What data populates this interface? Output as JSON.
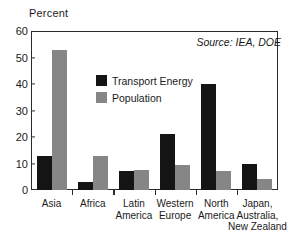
{
  "chart_data": {
    "type": "bar",
    "title": "",
    "xlabel": "",
    "ylabel": "Percent",
    "ylim": [
      0,
      60
    ],
    "yticks": [
      0,
      10,
      20,
      30,
      40,
      50,
      60
    ],
    "grid": false,
    "legend_position": "inside-upper-center",
    "categories": [
      "Asia",
      "Africa",
      "Latin\nAmerica",
      "Western\nEurope",
      "North\nAmerica",
      "Japan,\nAustralia,\nNew Zealand"
    ],
    "series": [
      {
        "name": "Transport Energy",
        "color": "#141414",
        "values": [
          13,
          3,
          7,
          21,
          40,
          10
        ]
      },
      {
        "name": "Population",
        "color": "#868686",
        "values": [
          53,
          13,
          7.5,
          9.5,
          7,
          4
        ]
      }
    ],
    "annotations": [
      {
        "name": "source",
        "text": "Source: IEA, DOE"
      }
    ]
  },
  "axis": {
    "y_title": "Percent",
    "y_tick_labels": [
      "60",
      "50",
      "40",
      "30",
      "20",
      "10",
      "0"
    ]
  },
  "legend": {
    "items": [
      {
        "label": "Transport Energy",
        "color": "#141414"
      },
      {
        "label": "Population",
        "color": "#868686"
      }
    ]
  },
  "source": {
    "text": "Source: IEA, DOE"
  },
  "colors": {
    "transport_energy": "#141414",
    "population": "#868686",
    "axis": "#2b2b2b",
    "text": "#1a1a1a",
    "background": "#ffffff"
  }
}
